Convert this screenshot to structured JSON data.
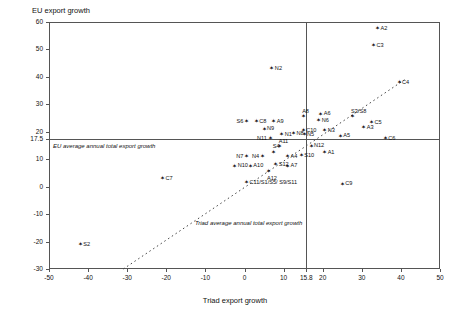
{
  "chart_data": {
    "type": "scatter",
    "title": "",
    "xlabel": "Triad export growth",
    "ylabel": "EU export growth",
    "xlim": [
      -50,
      50
    ],
    "ylim": [
      -30,
      60
    ],
    "xticks": [
      "-50",
      "-40",
      "-30",
      "-20",
      "-10",
      "0",
      "10",
      "15.8",
      "20",
      "30",
      "40",
      "50"
    ],
    "xtick_values": [
      -50,
      -40,
      -30,
      -20,
      -10,
      0,
      10,
      15.8,
      20,
      30,
      40,
      50
    ],
    "yticks": [
      "60",
      "50",
      "40",
      "30",
      "20",
      "17.5",
      "10",
      "0",
      "-10",
      "-20",
      "-30"
    ],
    "ytick_values": [
      60,
      50,
      40,
      30,
      20,
      17.5,
      10,
      0,
      -10,
      -20,
      -30
    ],
    "grid": false,
    "legend": "none",
    "reference_lines": [
      {
        "axis": "y",
        "value": 17.5,
        "label": "EU average annual total export growth"
      },
      {
        "axis": "x",
        "value": 15.8,
        "label": "Triad average annual total export growth"
      }
    ],
    "trend_line": {
      "style": "dashed",
      "x0": -31,
      "y0": -30,
      "x1": 41.5,
      "y1": 39.5
    },
    "points": [
      {
        "label": "A2",
        "x": 34.0,
        "y": 57.5,
        "lp": "lr"
      },
      {
        "label": "C3",
        "x": 33.0,
        "y": 51.5,
        "lp": "lr"
      },
      {
        "label": "C4",
        "x": 39.5,
        "y": 38.0,
        "lp": "lr"
      },
      {
        "label": "N2",
        "x": 7.0,
        "y": 43.0,
        "lp": "lr"
      },
      {
        "label": "S6",
        "x": 0.5,
        "y": 23.8,
        "lp": "ll"
      },
      {
        "label": "C8",
        "x": 3.0,
        "y": 23.8,
        "lp": "lr"
      },
      {
        "label": "A9",
        "x": 7.5,
        "y": 23.8,
        "lp": "lr"
      },
      {
        "label": "A8",
        "x": 15.0,
        "y": 25.5,
        "lp": "lt"
      },
      {
        "label": "A6",
        "x": 19.5,
        "y": 26.5,
        "lp": "lr"
      },
      {
        "label": "N6",
        "x": 19.0,
        "y": 24.0,
        "lp": "lr"
      },
      {
        "label": "S3/S8",
        "x": 27.5,
        "y": 25.5,
        "lp": "lt"
      },
      {
        "label": "C5",
        "x": 32.5,
        "y": 23.5,
        "lp": "lr"
      },
      {
        "label": "A3",
        "x": 30.5,
        "y": 21.5,
        "lp": "lr"
      },
      {
        "label": "N9",
        "x": 5.0,
        "y": 21.0,
        "lp": "lr"
      },
      {
        "label": "N1",
        "x": 9.5,
        "y": 19.0,
        "lp": "lr"
      },
      {
        "label": "N8",
        "x": 12.5,
        "y": 19.3,
        "lp": "lr"
      },
      {
        "label": "C10",
        "x": 15.0,
        "y": 20.5,
        "lp": "lr"
      },
      {
        "label": "N5",
        "x": 15.2,
        "y": 19.0,
        "lp": "lr"
      },
      {
        "label": "N3",
        "x": 20.5,
        "y": 20.5,
        "lp": "lr"
      },
      {
        "label": "A5",
        "x": 24.5,
        "y": 18.5,
        "lp": "lr"
      },
      {
        "label": "N11",
        "x": 6.5,
        "y": 17.6,
        "lp": "ll"
      },
      {
        "label": "C6",
        "x": 36.0,
        "y": 17.5,
        "lp": "lr"
      },
      {
        "label": "N12",
        "x": 17.0,
        "y": 14.8,
        "lp": "lr"
      },
      {
        "label": "A1",
        "x": 20.5,
        "y": 12.5,
        "lp": "lr"
      },
      {
        "label": "A11",
        "x": 9.0,
        "y": 14.5,
        "lp": "lt"
      },
      {
        "label": "S10",
        "x": 14.5,
        "y": 11.5,
        "lp": "lr"
      },
      {
        "label": "S4",
        "x": 7.5,
        "y": 12.5,
        "lp": "lt"
      },
      {
        "label": "A4",
        "x": 11.0,
        "y": 11.0,
        "lp": "lr"
      },
      {
        "label": "N7",
        "x": 0.5,
        "y": 11.0,
        "lp": "ll"
      },
      {
        "label": "N4",
        "x": 4.5,
        "y": 11.0,
        "lp": "ll"
      },
      {
        "label": "S12",
        "x": 8.0,
        "y": 8.0,
        "lp": "lr"
      },
      {
        "label": "A7",
        "x": 11.0,
        "y": 7.5,
        "lp": "lr"
      },
      {
        "label": "N10",
        "x": -2.5,
        "y": 7.5,
        "lp": "lr"
      },
      {
        "label": "A10",
        "x": 1.5,
        "y": 7.5,
        "lp": "lr"
      },
      {
        "label": "A12",
        "x": 6.0,
        "y": 5.5,
        "lp": "lb"
      },
      {
        "label": "C11/S1/S5/\nS9/S11",
        "x": 0.5,
        "y": 1.5,
        "lp": "lr"
      },
      {
        "label": "C7",
        "x": -21.0,
        "y": 3.0,
        "lp": "lr"
      },
      {
        "label": "C9",
        "x": 25.0,
        "y": 1.0,
        "lp": "lr"
      },
      {
        "label": "S2",
        "x": -42.0,
        "y": -21.0,
        "lp": "lr"
      }
    ]
  }
}
